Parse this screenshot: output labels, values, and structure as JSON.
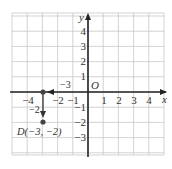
{
  "diagram": {
    "type": "coordinate-plane",
    "axes": {
      "x_label": "x",
      "y_label": "y",
      "origin_label": "O",
      "x_ticks": [
        {
          "value": -4,
          "label": "−4"
        },
        {
          "value": -2,
          "label": "−2"
        },
        {
          "value": -1,
          "label": "−1"
        },
        {
          "value": 1,
          "label": "1"
        },
        {
          "value": 2,
          "label": "2"
        },
        {
          "value": 3,
          "label": "3"
        },
        {
          "value": 4,
          "label": "4"
        }
      ],
      "y_ticks": [
        {
          "value": 4,
          "label": "4"
        },
        {
          "value": 3,
          "label": "3"
        },
        {
          "value": 2,
          "label": "2"
        },
        {
          "value": 1,
          "label": "1"
        },
        {
          "value": -1,
          "label": "−1"
        },
        {
          "value": -2,
          "label": "−2"
        },
        {
          "value": -3,
          "label": "−3"
        }
      ]
    },
    "grid": {
      "x_min": -5,
      "x_max": 5,
      "y_min": -4,
      "y_max": 5
    },
    "moves": [
      {
        "from": [
          0,
          0
        ],
        "to": [
          -3,
          0
        ],
        "label": "−3",
        "direction": "left"
      },
      {
        "from": [
          -3,
          0
        ],
        "to": [
          -3,
          -2
        ],
        "label": "−2",
        "direction": "down"
      }
    ],
    "points": [
      {
        "name": "start",
        "x": -3,
        "y": 0,
        "label": ""
      },
      {
        "name": "D",
        "x": -3,
        "y": -2,
        "label": "D(−3, −2)"
      }
    ],
    "colors": {
      "grid": "#c8c8c8",
      "axis": "#222222",
      "point": "#444444",
      "text": "#333333"
    }
  }
}
